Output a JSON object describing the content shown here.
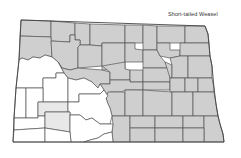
{
  "title": "Short-tailed Weasel",
  "map": {
    "region": "North Dakota counties",
    "legend_colors": {
      "present": "#cfcfcf",
      "light": "#e8e8e8",
      "absent": "#ffffff",
      "border": "#555555"
    }
  }
}
